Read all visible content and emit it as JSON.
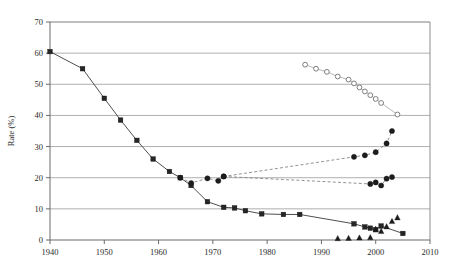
{
  "chart_data": {
    "type": "line",
    "title": "",
    "xlabel": "",
    "ylabel": "Rate (%)",
    "xlim": [
      1940,
      2010
    ],
    "ylim": [
      0,
      70
    ],
    "xticks": [
      1940,
      1950,
      1960,
      1970,
      1980,
      1990,
      2000,
      2010
    ],
    "yticks": [
      0,
      10,
      20,
      30,
      40,
      50,
      60,
      70
    ],
    "grid": "horizontal",
    "legend": "none",
    "series": [
      {
        "name": "filled-squares-declining",
        "marker": "filled-square",
        "line": "solid",
        "x": [
          1940,
          1946,
          1950,
          1953,
          1956,
          1959,
          1962,
          1964,
          1966,
          1969,
          1972,
          1974,
          1976,
          1979,
          1983,
          1986,
          1996,
          1998,
          1999,
          2000,
          2001,
          2005
        ],
        "y": [
          60.5,
          55.0,
          45.5,
          38.5,
          32.0,
          26.0,
          22.0,
          20.0,
          17.5,
          12.3,
          10.5,
          10.3,
          9.4,
          8.4,
          8.2,
          8.2,
          5.2,
          4.2,
          3.8,
          3.3,
          4.5,
          2.1
        ]
      },
      {
        "name": "filled-circles-upper-branch",
        "marker": "filled-circle",
        "line": "dashed",
        "x": [
          1964,
          1966,
          1969,
          1971,
          1972,
          1996,
          1998,
          2000,
          2002,
          2003
        ],
        "y": [
          20.0,
          18.3,
          19.8,
          19.0,
          20.4,
          26.7,
          27.2,
          28.2,
          31.0,
          35.0
        ]
      },
      {
        "name": "filled-circles-lower-branch",
        "marker": "filled-circle",
        "line": "dashed",
        "x": [
          1972,
          1999,
          2000,
          2001,
          2002,
          2003
        ],
        "y": [
          20.4,
          18.0,
          18.5,
          17.5,
          19.7,
          20.2
        ]
      },
      {
        "name": "open-circles",
        "marker": "open-circle",
        "line": "faint",
        "x": [
          1987,
          1989,
          1991,
          1993,
          1995,
          1996,
          1997,
          1998,
          1999,
          2000,
          2001,
          2004
        ],
        "y": [
          56.3,
          55.0,
          54.0,
          52.5,
          51.5,
          50.3,
          49.0,
          47.7,
          46.5,
          45.3,
          44.0,
          40.3
        ]
      },
      {
        "name": "filled-triangles",
        "marker": "filled-triangle",
        "line": "none",
        "x": [
          1993,
          1995,
          1997,
          1999,
          2000,
          2001,
          2002,
          2003,
          2004
        ],
        "y": [
          0.5,
          0.6,
          0.7,
          0.8,
          3.5,
          2.8,
          4.3,
          6.0,
          7.2
        ]
      }
    ]
  }
}
